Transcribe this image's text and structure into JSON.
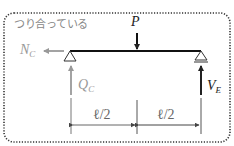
{
  "diagram": {
    "title": "つり合っている",
    "load": {
      "label": "P"
    },
    "forces": {
      "N": {
        "main": "N",
        "sub": "C",
        "direction": "left",
        "color": "#999999"
      },
      "Q": {
        "main": "Q",
        "sub": "C",
        "direction": "up",
        "color": "#999999"
      },
      "V": {
        "main": "V",
        "sub": "E",
        "direction": "up",
        "color": "#222222"
      }
    },
    "dimensions": [
      {
        "label": "ℓ/2"
      },
      {
        "label": "ℓ/2"
      }
    ],
    "supports": [
      "pin-left",
      "roller-right"
    ],
    "border_style": "dotted-rounded"
  }
}
